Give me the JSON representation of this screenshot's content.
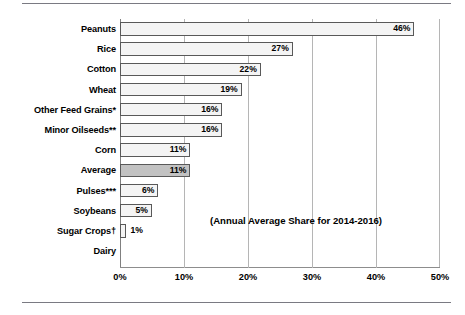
{
  "chart_data": {
    "type": "bar",
    "orientation": "horizontal",
    "title": "",
    "xlabel": "",
    "ylabel": "",
    "xlim": [
      0,
      50
    ],
    "xticks": [
      "0%",
      "10%",
      "20%",
      "30%",
      "40%",
      "50%"
    ],
    "xtick_values": [
      0,
      10,
      20,
      30,
      40,
      50
    ],
    "grid": "vertical",
    "legend": "none",
    "annotation": "(Annual Average Share for 2014-2016)",
    "categories": [
      "Peanuts",
      "Rice",
      "Cotton",
      "Wheat",
      "Other Feed Grains*",
      "Minor Oilseeds**",
      "Corn",
      "Average",
      "Pulses***",
      "Soybeans",
      "Sugar Crops†",
      "Dairy"
    ],
    "values": [
      46,
      27,
      22,
      19,
      16,
      16,
      11,
      11,
      6,
      5,
      1,
      0
    ],
    "value_labels": [
      "46%",
      "27%",
      "22%",
      "19%",
      "16%",
      "16%",
      "11%",
      "11%",
      "6%",
      "5%",
      "1%",
      ""
    ],
    "highlight_category": "Average",
    "colors": {
      "bar_fill": "#f4f4f4",
      "bar_highlight_fill": "#c2c2c2",
      "bar_edge": "#595959",
      "gridline": "#b5b5b5",
      "axis": "#808080",
      "text": "#000000"
    }
  }
}
